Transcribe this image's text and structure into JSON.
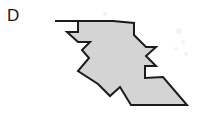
{
  "figure": {
    "label": "D",
    "caption_present": false,
    "background_color": "#ffffff",
    "fill_color": "#d4d4d4",
    "stroke_color": "#1c1c1c",
    "stroke_width": 2,
    "shape_outline_points": "55,21 113,21 134,23 134,35 146,47 156,47 146,56 156,66 145,66 145,78 163,77 187,105 131,105 120,87 110,96 98,84 78,71 89,58 82,50 90,42 78,42 67,32 78,32 78,21",
    "parts": [
      {
        "name": "upper-left-triangle",
        "vertices": "55,21 113,21 84,50"
      },
      {
        "name": "central-rotated-cross",
        "vertices": "84,50 113,21 122,32 134,23 156,46 145,56 156,66 134,88 122,77 110,96 84,70 95,59"
      },
      {
        "name": "lower-right-triangle",
        "vertices": "134,88 163,77 187,105 131,105"
      }
    ],
    "speckles": [
      {
        "x": 178,
        "y": 30,
        "r": 3
      },
      {
        "x": 183,
        "y": 41,
        "r": 2
      },
      {
        "x": 176,
        "y": 48,
        "r": 2
      },
      {
        "x": 186,
        "y": 53,
        "r": 2
      },
      {
        "x": 104,
        "y": 13,
        "r": 2
      }
    ]
  }
}
